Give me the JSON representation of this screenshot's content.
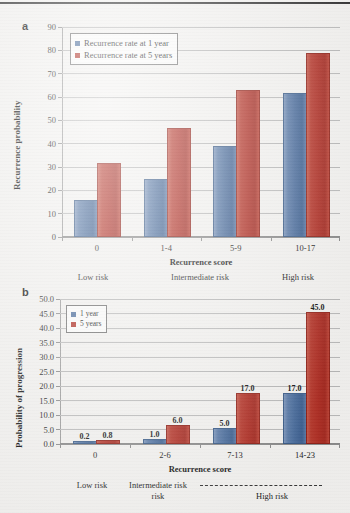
{
  "figure": {
    "panels": [
      "a",
      "b"
    ]
  },
  "panel_a": {
    "letter": "a",
    "ylabel": "Recurrence probability",
    "xlabel": "Recurrence score",
    "legend": [
      {
        "label": "Recurrence rate at 1 year",
        "color": "#4a6c9b"
      },
      {
        "label": "Recurrence rate at 5 years",
        "color": "#ae2f25"
      }
    ],
    "yticks": [
      "0",
      "10",
      "20",
      "30",
      "40",
      "50",
      "60",
      "70",
      "80",
      "90"
    ],
    "xticks": [
      "0",
      "1-4",
      "5-9",
      "10-17"
    ],
    "risk_groups": [
      "Low risk",
      "Intermediate risk",
      "High risk"
    ]
  },
  "panel_b": {
    "letter": "b",
    "ylabel": "Probability of progression",
    "xlabel": "Recurrence score",
    "legend": [
      {
        "label": "1 year",
        "color": "#4a6c9b"
      },
      {
        "label": "5 years",
        "color": "#ae2f25"
      }
    ],
    "yticks": [
      "0.0",
      "5.0",
      "10.0",
      "15.0",
      "20.0",
      "25.0",
      "30.0",
      "35.0",
      "40.0",
      "45.0",
      "50.0"
    ],
    "xticks": [
      "0",
      "2-6",
      "7-13",
      "14-23"
    ],
    "risk_groups": [
      "Low risk",
      "Intermediate risk",
      "High risk"
    ],
    "risk_group_intermediate_line2": "risk"
  },
  "chart_data": [
    {
      "type": "bar",
      "panel": "a",
      "title": "",
      "xlabel": "Recurrence score",
      "ylabel": "Recurrence probability",
      "categories": [
        "0",
        "1-4",
        "5-9",
        "10-17"
      ],
      "category_groups": [
        "Low risk",
        "Intermediate risk",
        "Intermediate risk",
        "High risk"
      ],
      "series": [
        {
          "name": "Recurrence rate at 1 year",
          "color": "#4a6c9b",
          "values": [
            15,
            24,
            38,
            61
          ]
        },
        {
          "name": "Recurrence rate at 5 years",
          "color": "#ae2f25",
          "values": [
            31,
            46,
            62,
            78
          ]
        }
      ],
      "ylim": [
        0,
        90
      ],
      "ytick_step": 10,
      "grid": true,
      "legend_position": "upper-left",
      "data_labels": false
    },
    {
      "type": "bar",
      "panel": "b",
      "title": "",
      "xlabel": "Recurrence score",
      "ylabel": "Probability of progression",
      "categories": [
        "0",
        "2-6",
        "7-13",
        "14-23"
      ],
      "category_groups": [
        "Low risk",
        "Intermediate risk",
        "High risk",
        "High risk"
      ],
      "series": [
        {
          "name": "1 year",
          "color": "#4a6c9b",
          "values": [
            0.2,
            1.0,
            5.0,
            17.0
          ]
        },
        {
          "name": "5 years",
          "color": "#ae2f25",
          "values": [
            0.8,
            6.0,
            17.0,
            45.0
          ]
        }
      ],
      "ylim": [
        0,
        50
      ],
      "ytick_step": 5,
      "grid": true,
      "legend_position": "upper-left",
      "data_labels": true,
      "data_label_values": [
        "0.2",
        "0.8",
        "1.0",
        "6.0",
        "5.0",
        "17.0",
        "17.0",
        "45.0"
      ]
    }
  ]
}
